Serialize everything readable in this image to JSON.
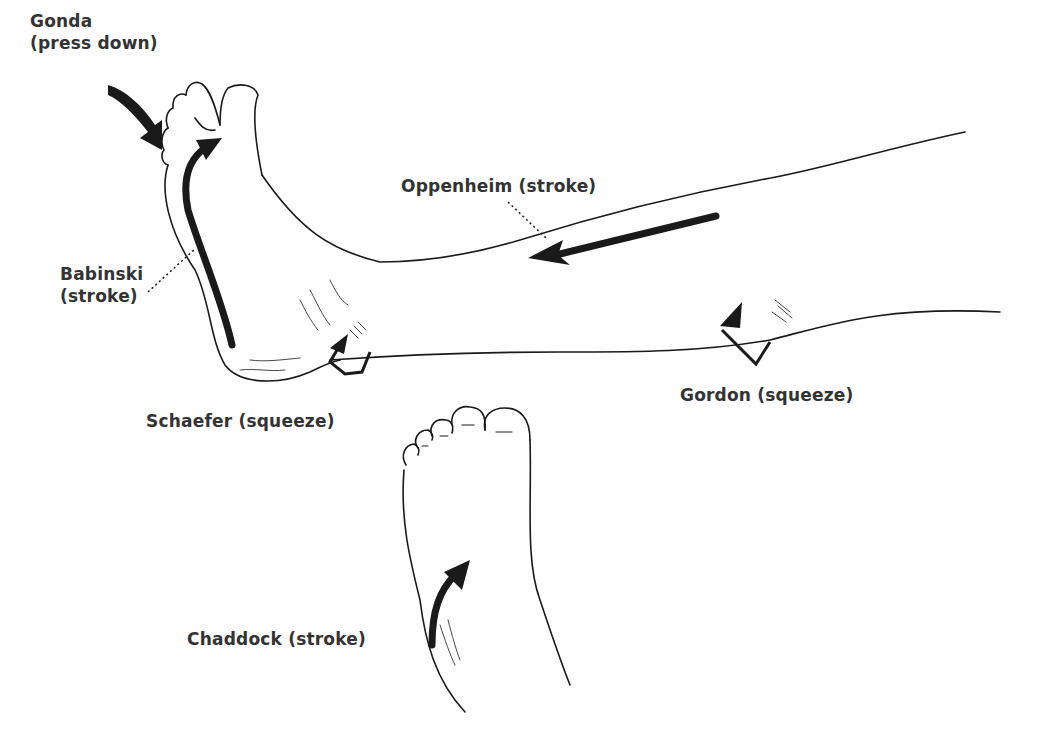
{
  "labels": {
    "gonda": {
      "name": "Gonda",
      "action": "(press down)"
    },
    "oppenheim": "Oppenheim (stroke)",
    "babinski": {
      "name": "Babinski",
      "action": "(stroke)"
    },
    "schaefer": "Schaefer (squeeze)",
    "gordon": "Gordon (squeeze)",
    "chaddock": "Chaddock (stroke)"
  },
  "colors": {
    "ink": "#1a1a1a",
    "text": "#333333",
    "background": "#fefefe"
  }
}
